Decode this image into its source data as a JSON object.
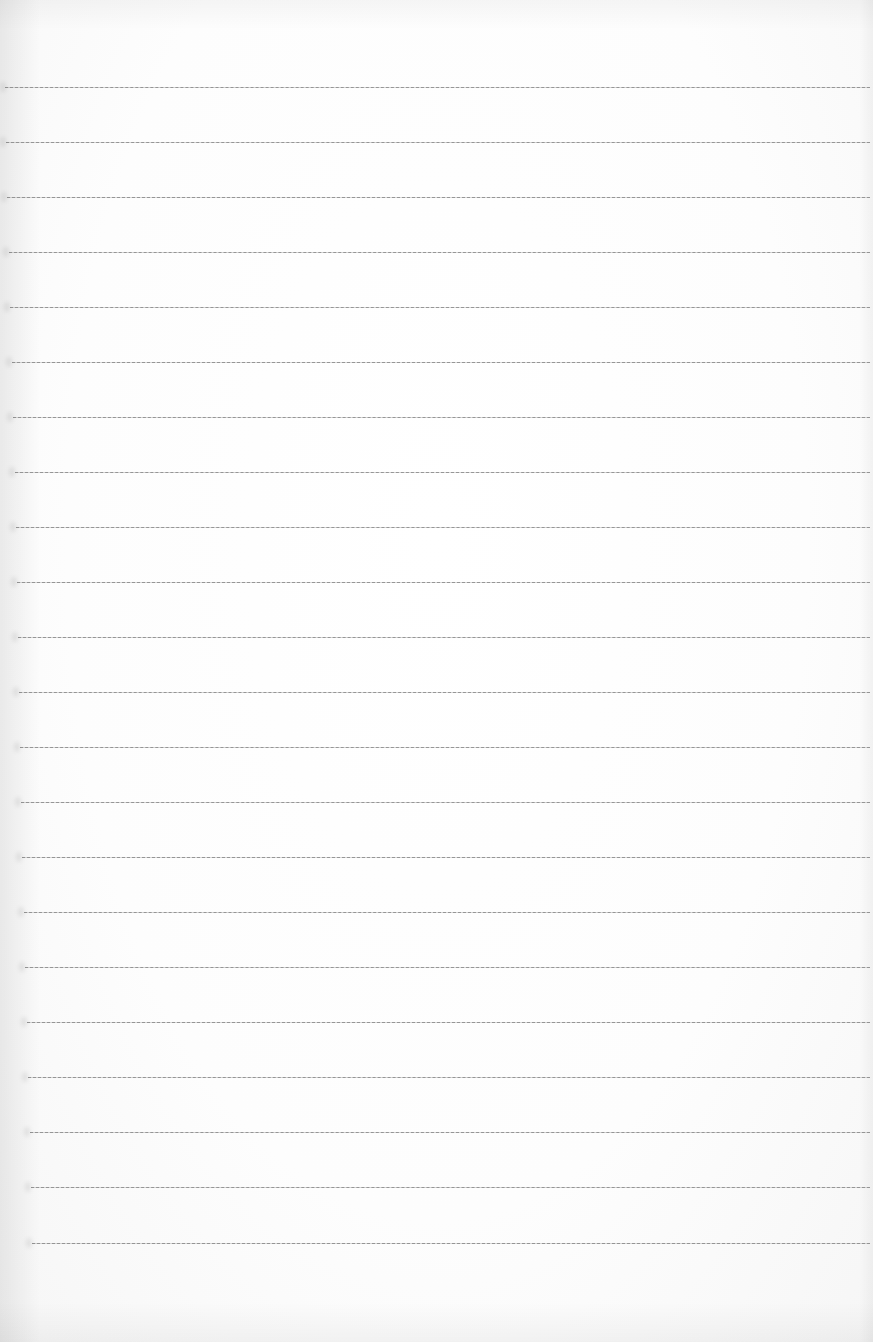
{
  "page": {
    "type": "lined-paper",
    "content": "",
    "background_color": "#ffffff",
    "line_color": "#8a8a8a",
    "line_count": 22,
    "line_spacing_px": 55
  },
  "rules": [
    {
      "y": 87,
      "x_start": 5,
      "x_end": 870
    },
    {
      "y": 142,
      "x_start": 6,
      "x_end": 870
    },
    {
      "y": 197,
      "x_start": 7,
      "x_end": 870
    },
    {
      "y": 252,
      "x_start": 9,
      "x_end": 870
    },
    {
      "y": 307,
      "x_start": 10,
      "x_end": 870
    },
    {
      "y": 362,
      "x_start": 12,
      "x_end": 870
    },
    {
      "y": 417,
      "x_start": 13,
      "x_end": 870
    },
    {
      "y": 472,
      "x_start": 15,
      "x_end": 870
    },
    {
      "y": 527,
      "x_start": 16,
      "x_end": 870
    },
    {
      "y": 582,
      "x_start": 17,
      "x_end": 870
    },
    {
      "y": 637,
      "x_start": 18,
      "x_end": 870
    },
    {
      "y": 692,
      "x_start": 19,
      "x_end": 870
    },
    {
      "y": 747,
      "x_start": 20,
      "x_end": 870
    },
    {
      "y": 802,
      "x_start": 21,
      "x_end": 870
    },
    {
      "y": 857,
      "x_start": 22,
      "x_end": 870
    },
    {
      "y": 912,
      "x_start": 24,
      "x_end": 870
    },
    {
      "y": 967,
      "x_start": 25,
      "x_end": 870
    },
    {
      "y": 1022,
      "x_start": 27,
      "x_end": 870
    },
    {
      "y": 1077,
      "x_start": 28,
      "x_end": 870
    },
    {
      "y": 1132,
      "x_start": 30,
      "x_end": 870
    },
    {
      "y": 1187,
      "x_start": 31,
      "x_end": 870
    },
    {
      "y": 1243,
      "x_start": 32,
      "x_end": 870
    }
  ]
}
